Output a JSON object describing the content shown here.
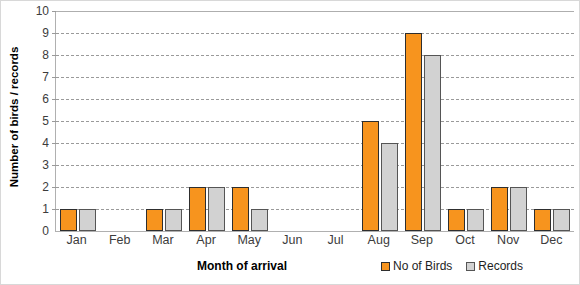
{
  "chart_data": {
    "type": "bar",
    "title": "",
    "xlabel": "Month of arrival",
    "ylabel": "Number of birds / records",
    "categories": [
      "Jan",
      "Feb",
      "Mar",
      "Apr",
      "May",
      "Jun",
      "Jul",
      "Aug",
      "Sep",
      "Oct",
      "Nov",
      "Dec"
    ],
    "series": [
      {
        "name": "No of Birds",
        "color": "#f7941e",
        "border_color": "#2e2e2e",
        "values": [
          1,
          0,
          1,
          2,
          2,
          0,
          0,
          5,
          9,
          1,
          2,
          1
        ]
      },
      {
        "name": "Records",
        "color": "#d2d2d2",
        "border_color": "#555555",
        "values": [
          1,
          0,
          1,
          2,
          1,
          0,
          0,
          4,
          8,
          1,
          2,
          1
        ]
      }
    ],
    "ylim": [
      0,
      10
    ],
    "ytick_step": 1,
    "yticks": [
      0,
      1,
      2,
      3,
      4,
      5,
      6,
      7,
      8,
      9,
      10
    ],
    "ytick_labels": [
      "0",
      "1",
      "2",
      "3",
      "4",
      "5",
      "6",
      "7",
      "8",
      "9",
      "10"
    ],
    "grid": true,
    "grid_style": "dashed",
    "legend_position": "bottom-right"
  }
}
